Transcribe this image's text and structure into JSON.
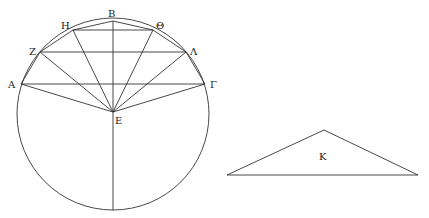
{
  "diagram": {
    "circle": {
      "cx": 113,
      "cy": 114,
      "r": 96
    },
    "points": {
      "A": {
        "label": "Α",
        "x": 21,
        "y": 84,
        "lx": 8,
        "ly": 87
      },
      "Z": {
        "label": "Ζ",
        "x": 40,
        "y": 52,
        "lx": 29,
        "ly": 55
      },
      "H": {
        "label": "Η",
        "x": 73,
        "y": 30,
        "lx": 61,
        "ly": 29
      },
      "B": {
        "label": "Β",
        "x": 113,
        "y": 21,
        "lx": 108,
        "ly": 17
      },
      "Theta": {
        "label": "Θ",
        "x": 153,
        "y": 30,
        "lx": 156,
        "ly": 29
      },
      "Lambda": {
        "label": "Λ",
        "x": 186,
        "y": 52,
        "lx": 190,
        "ly": 55
      },
      "Gamma": {
        "label": "Γ",
        "x": 205,
        "y": 84,
        "lx": 210,
        "ly": 87
      },
      "E": {
        "label": "Ε",
        "x": 113,
        "y": 112,
        "lx": 115,
        "ly": 124
      }
    },
    "triangle": {
      "left": {
        "x": 227,
        "y": 175
      },
      "apex": {
        "x": 324,
        "y": 130
      },
      "right": {
        "x": 418,
        "y": 175
      },
      "label": "Κ",
      "lx": 319,
      "ly": 160
    }
  }
}
